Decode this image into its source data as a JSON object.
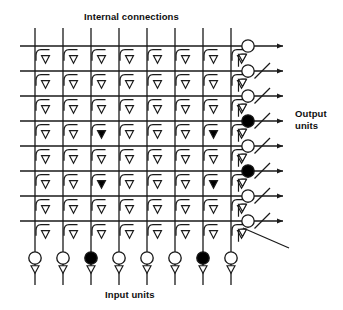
{
  "figure": {
    "type": "neural-network-crossbar-diagram",
    "title_top": "Internal connections",
    "label_bottom": "Input units",
    "label_right": "Output\nunits",
    "label_right_line1": "Output",
    "label_right_line2": "units"
  },
  "colors": {
    "line": "#1a1a1a",
    "fill_active": "#000000",
    "fill_inactive": "#ffffff",
    "background": "#ffffff",
    "text": "#101010"
  },
  "geometry": {
    "width": 343,
    "height": 310,
    "column_x": [
      35,
      63,
      91,
      119,
      147,
      175,
      203,
      231
    ],
    "output_column_x": 248,
    "row_y": [
      46,
      71,
      96,
      121,
      146,
      171,
      196,
      221
    ],
    "grid_left": 20,
    "grid_top": 28,
    "column_top_y": 28,
    "column_bottom_y": 285,
    "row_right_x": 285,
    "arrow_x": 283,
    "input_circle_y": 258,
    "unit_radius": 6.2,
    "cell_triangle_size": 8
  },
  "counts": {
    "columns": 8,
    "rows": 8,
    "input_units": 8,
    "output_units": 8,
    "cells": 64
  },
  "input_units": [
    {
      "index": 1,
      "x": 35,
      "active": false,
      "state": "open"
    },
    {
      "index": 2,
      "x": 63,
      "active": false,
      "state": "open"
    },
    {
      "index": 3,
      "x": 91,
      "active": true,
      "state": "filled"
    },
    {
      "index": 4,
      "x": 119,
      "active": false,
      "state": "open"
    },
    {
      "index": 5,
      "x": 147,
      "active": false,
      "state": "open"
    },
    {
      "index": 6,
      "x": 175,
      "active": false,
      "state": "open"
    },
    {
      "index": 7,
      "x": 203,
      "active": true,
      "state": "filled"
    },
    {
      "index": 8,
      "x": 231,
      "active": false,
      "state": "open"
    }
  ],
  "output_units": [
    {
      "index": 1,
      "y": 46,
      "active": false,
      "state": "open",
      "has_diagonal": false
    },
    {
      "index": 2,
      "y": 71,
      "active": false,
      "state": "open",
      "has_diagonal": true
    },
    {
      "index": 3,
      "y": 96,
      "active": false,
      "state": "open",
      "has_diagonal": true
    },
    {
      "index": 4,
      "y": 121,
      "active": true,
      "state": "filled",
      "has_diagonal": true
    },
    {
      "index": 5,
      "y": 146,
      "active": false,
      "state": "open",
      "has_diagonal": true
    },
    {
      "index": 6,
      "y": 171,
      "active": true,
      "state": "filled",
      "has_diagonal": true
    },
    {
      "index": 7,
      "y": 196,
      "active": false,
      "state": "open",
      "has_diagonal": true
    },
    {
      "index": 8,
      "y": 221,
      "active": false,
      "state": "open",
      "has_diagonal": true
    }
  ],
  "synapse_grid": {
    "description": "8 rows x 8 columns of junction synapses; filled triangle = active synapse",
    "active_cells": [
      {
        "row": 4,
        "col": 3
      },
      {
        "row": 4,
        "col": 7
      },
      {
        "row": 6,
        "col": 3
      },
      {
        "row": 6,
        "col": 7
      }
    ],
    "rows": [
      [
        false,
        false,
        false,
        false,
        false,
        false,
        false,
        false
      ],
      [
        false,
        false,
        false,
        false,
        false,
        false,
        false,
        false
      ],
      [
        false,
        false,
        false,
        false,
        false,
        false,
        false,
        false
      ],
      [
        false,
        false,
        true,
        false,
        false,
        false,
        true,
        false
      ],
      [
        false,
        false,
        false,
        false,
        false,
        false,
        false,
        false
      ],
      [
        false,
        false,
        true,
        false,
        false,
        false,
        true,
        false
      ],
      [
        false,
        false,
        false,
        false,
        false,
        false,
        false,
        false
      ],
      [
        false,
        false,
        false,
        false,
        false,
        false,
        false,
        false
      ]
    ]
  }
}
